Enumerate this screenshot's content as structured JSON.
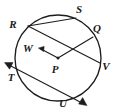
{
  "figure": {
    "type": "circle-geometry-diagram",
    "background_color": "#ffffff",
    "ink_color": "#1d1d1d"
  },
  "circle": {
    "name": "circle-P",
    "center_label": "P",
    "center": {
      "x": 58,
      "y": 58
    },
    "radius": 43
  },
  "points": [
    {
      "id": "R",
      "label": "R",
      "label_x": 13,
      "label_y": 28,
      "on_circle": true,
      "x": 28,
      "y": 26
    },
    {
      "id": "S",
      "label": "S",
      "label_x": 79,
      "label_y": 13,
      "on_circle": true,
      "x": 76,
      "y": 18
    },
    {
      "id": "Q",
      "label": "Q",
      "label_x": 96,
      "label_y": 31,
      "on_circle": true,
      "x": 93,
      "y": 37
    },
    {
      "id": "W",
      "label": "W",
      "label_x": 28,
      "label_y": 51,
      "on_circle": false,
      "x": 39,
      "y": 49
    },
    {
      "id": "P",
      "label": "P",
      "label_x": 55,
      "label_y": 72,
      "on_circle": false,
      "x": 58,
      "y": 58
    },
    {
      "id": "V",
      "label": "V",
      "label_x": 101,
      "label_y": 70,
      "on_circle": true,
      "x": 100,
      "y": 63
    },
    {
      "id": "T",
      "label": "T",
      "label_x": 10,
      "label_y": 80,
      "on_circle": true,
      "x": 20,
      "y": 74
    },
    {
      "id": "U",
      "label": "U",
      "label_x": 62,
      "label_y": 106,
      "on_circle": true,
      "x": 69,
      "y": 99
    }
  ],
  "segments": [
    {
      "id": "chord-RS",
      "name": "chord-r-s",
      "from": "R",
      "to": "S",
      "kind": "chord"
    },
    {
      "id": "chord-RV",
      "name": "chord-r-v",
      "from": "R",
      "to": "V",
      "kind": "chord-through-center"
    },
    {
      "id": "radius-PQ",
      "name": "radius-p-q",
      "from": "P",
      "to": "Q",
      "kind": "radius"
    },
    {
      "id": "radius-PW",
      "name": "radius-p-w-arrow",
      "from": "P",
      "to": "W",
      "kind": "arrow"
    },
    {
      "id": "secant-TU",
      "name": "secant-t-u",
      "from": "T",
      "to": "U",
      "kind": "secant-double-arrow"
    }
  ],
  "arrows": [
    {
      "id": "arrow-W",
      "name": "arrowhead-at-w",
      "at_point": "W",
      "direction": "left"
    },
    {
      "id": "arrow-T",
      "name": "arrowhead-beyond-t",
      "at_point": "T",
      "direction": "upper-left"
    },
    {
      "id": "arrow-U",
      "name": "arrowhead-beyond-u",
      "at_point": "U",
      "direction": "lower-right"
    }
  ],
  "labels_list": [
    "R",
    "S",
    "Q",
    "W",
    "P",
    "V",
    "T",
    "U"
  ]
}
